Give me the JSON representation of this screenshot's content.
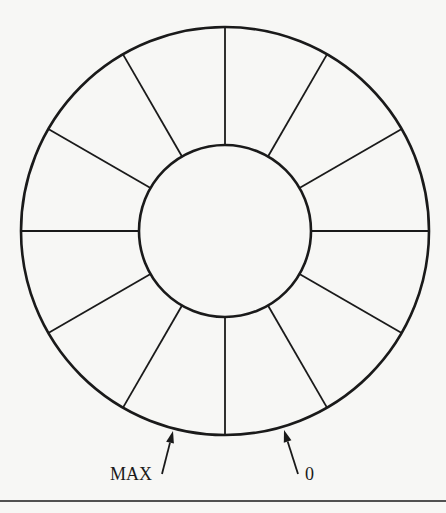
{
  "diagram": {
    "type": "circular-buffer",
    "center": [
      225,
      231
    ],
    "outer_radius": 204,
    "inner_radius": 86,
    "segments": 12,
    "stroke_color": "#1a1a1a",
    "background": "#f7f7f5",
    "pointers": [
      {
        "label": "MAX",
        "tip": [
          173,
          431
        ],
        "tail": [
          162,
          474
        ],
        "text_x": 152,
        "text_y": 480,
        "anchor": "end"
      },
      {
        "label": "0",
        "tip": [
          284,
          430
        ],
        "tail": [
          298,
          474
        ],
        "text_x": 305,
        "text_y": 480,
        "anchor": "start"
      }
    ],
    "bottom_rule_y": 501
  }
}
